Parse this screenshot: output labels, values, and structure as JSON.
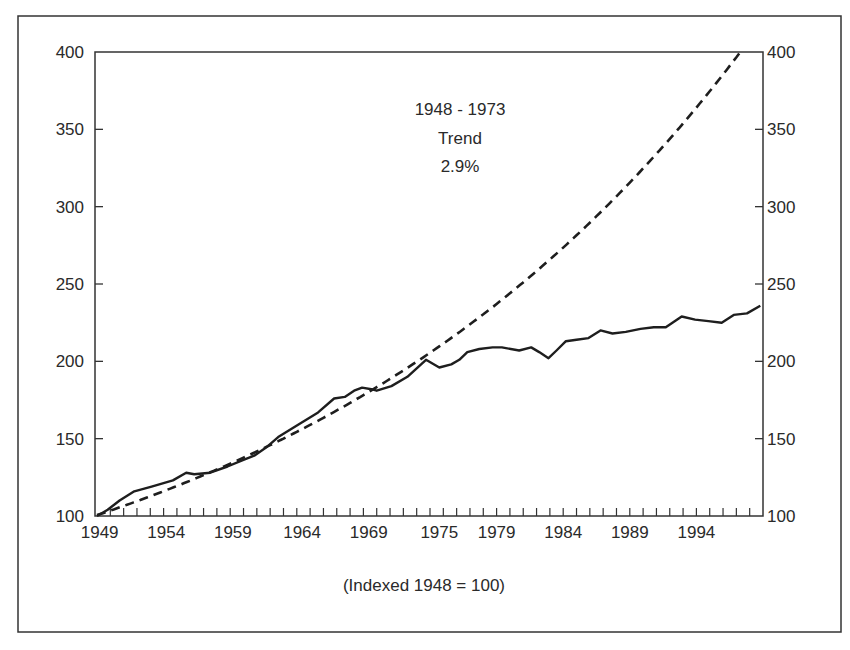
{
  "chart_data": {
    "type": "line",
    "title": "",
    "subtitle": "",
    "caption": "(Indexed 1948 = 100)",
    "xlabel": "",
    "ylabel": "",
    "annotation": {
      "lines": [
        "1948 - 1973",
        "Trend",
        "2.9%"
      ]
    },
    "x_range": [
      1949,
      1999
    ],
    "ylim": [
      100,
      400
    ],
    "y_ticks": [
      100,
      150,
      200,
      250,
      300,
      350,
      400
    ],
    "y_ticks_right": [
      100,
      150,
      200,
      250,
      300,
      350,
      400
    ],
    "x_tick_labels": [
      {
        "label": "1949",
        "pos": 1949.2
      },
      {
        "label": "1954",
        "pos": 1954.2
      },
      {
        "label": "1959",
        "pos": 1959.2
      },
      {
        "label": "1964",
        "pos": 1964.4
      },
      {
        "label": "1969",
        "pos": 1969.4
      },
      {
        "label": "1975",
        "pos": 1974.7
      },
      {
        "label": "1979",
        "pos": 1979.0
      },
      {
        "label": "1984",
        "pos": 1984.0
      },
      {
        "label": "1989",
        "pos": 1989.0
      },
      {
        "label": "1994",
        "pos": 1994.0
      }
    ],
    "minor_ticks_every_year": true,
    "grid": false,
    "legend": null,
    "series": [
      {
        "name": "Actual (indexed)",
        "style": "solid",
        "color": "#1e1e1e",
        "points": [
          [
            1949.0,
            100
          ],
          [
            1949.8,
            104
          ],
          [
            1950.7,
            110
          ],
          [
            1951.8,
            116
          ],
          [
            1953.1,
            119
          ],
          [
            1954.7,
            123
          ],
          [
            1955.7,
            128
          ],
          [
            1956.3,
            127
          ],
          [
            1957.5,
            128
          ],
          [
            1958.8,
            132
          ],
          [
            1959.9,
            136
          ],
          [
            1960.8,
            139
          ],
          [
            1961.8,
            145
          ],
          [
            1962.6,
            151
          ],
          [
            1964.1,
            159
          ],
          [
            1965.6,
            167
          ],
          [
            1966.8,
            176
          ],
          [
            1967.6,
            177
          ],
          [
            1968.3,
            181
          ],
          [
            1968.9,
            183
          ],
          [
            1969.6,
            182
          ],
          [
            1970.0,
            181
          ],
          [
            1971.1,
            184
          ],
          [
            1972.3,
            190
          ],
          [
            1973.7,
            201
          ],
          [
            1974.7,
            196
          ],
          [
            1975.6,
            198
          ],
          [
            1976.2,
            201
          ],
          [
            1976.8,
            206
          ],
          [
            1977.7,
            208
          ],
          [
            1978.7,
            209
          ],
          [
            1979.4,
            209
          ],
          [
            1980.7,
            207
          ],
          [
            1981.6,
            209
          ],
          [
            1982.2,
            206
          ],
          [
            1982.9,
            202
          ],
          [
            1983.5,
            207
          ],
          [
            1984.2,
            213
          ],
          [
            1985.0,
            214
          ],
          [
            1985.9,
            215
          ],
          [
            1986.8,
            220
          ],
          [
            1987.7,
            218
          ],
          [
            1988.7,
            219
          ],
          [
            1989.8,
            221
          ],
          [
            1990.8,
            222
          ],
          [
            1991.7,
            222
          ],
          [
            1992.9,
            229
          ],
          [
            1993.9,
            227
          ],
          [
            1994.9,
            226
          ],
          [
            1995.9,
            225
          ],
          [
            1996.8,
            230
          ],
          [
            1997.8,
            231
          ],
          [
            1998.8,
            236
          ]
        ]
      },
      {
        "name": "1948 - 1973 Trend (2.9%)",
        "style": "dashed",
        "color": "#1e1e1e",
        "growth_rate": 0.029,
        "base_year": 1948.8,
        "base_value": 100,
        "points": [
          [
            1949.0,
            100.6
          ],
          [
            1954.0,
            116
          ],
          [
            1959.0,
            134
          ],
          [
            1964.0,
            154
          ],
          [
            1969.0,
            178
          ],
          [
            1973.2,
            201
          ],
          [
            1975.0,
            212
          ],
          [
            1980.7,
            249
          ],
          [
            1985.0,
            281
          ],
          [
            1988.2,
            308
          ],
          [
            1990.0,
            325
          ],
          [
            1993.0,
            354
          ],
          [
            1995.0,
            375
          ],
          [
            1997.3,
            400
          ]
        ]
      }
    ]
  },
  "colors": {
    "ink": "#1e1e1e",
    "frame": "#333333",
    "background": "#ffffff"
  }
}
